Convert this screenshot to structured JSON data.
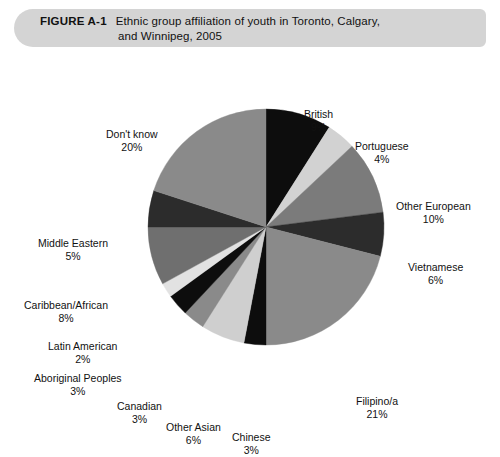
{
  "figure": {
    "label": "FIGURE A-1",
    "caption_line_1": "Ethnic group affiliation of youth in Toronto, Calgary,",
    "caption_line_2": "and Winnipeg, 2005",
    "header_bg": "#d4d4d4"
  },
  "chart_data": {
    "type": "pie",
    "title": "Ethnic group affiliation of youth in Toronto, Calgary, and Winnipeg, 2005",
    "xlabel": "",
    "ylabel": "",
    "legend_position": "none",
    "labels_outside": true,
    "start_angle_deg": 0,
    "direction": "clockwise",
    "units": "percent",
    "categories": [
      "British",
      "Portuguese",
      "Other European",
      "Vietnamese",
      "Filipino/a",
      "Chinese",
      "Other Asian",
      "Canadian",
      "Aboriginal Peoples",
      "Latin American",
      "Caribbean/African",
      "Middle Eastern",
      "Don't know"
    ],
    "values": [
      9,
      4,
      10,
      6,
      21,
      3,
      6,
      3,
      3,
      2,
      8,
      5,
      20
    ],
    "total": 100,
    "colors": [
      "#0d0d0d",
      "#d2d2d2",
      "#7b7b7b",
      "#2c2c2c",
      "#8a8a8a",
      "#0d0d0d",
      "#cfcfcf",
      "#8a8a8a",
      "#0d0d0d",
      "#e2e2e2",
      "#6f6f6f",
      "#2c2c2c",
      "#8a8a8a"
    ],
    "slices": [
      {
        "name": "British",
        "value": 9,
        "value_label": "9%",
        "color": "#0d0d0d"
      },
      {
        "name": "Portuguese",
        "value": 4,
        "value_label": "4%",
        "color": "#d2d2d2"
      },
      {
        "name": "Other European",
        "value": 10,
        "value_label": "10%",
        "color": "#7b7b7b"
      },
      {
        "name": "Vietnamese",
        "value": 6,
        "value_label": "6%",
        "color": "#2c2c2c"
      },
      {
        "name": "Filipino/a",
        "value": 21,
        "value_label": "21%",
        "color": "#8a8a8a"
      },
      {
        "name": "Chinese",
        "value": 3,
        "value_label": "3%",
        "color": "#0d0d0d"
      },
      {
        "name": "Other Asian",
        "value": 6,
        "value_label": "6%",
        "color": "#cfcfcf"
      },
      {
        "name": "Canadian",
        "value": 3,
        "value_label": "3%",
        "color": "#8a8a8a"
      },
      {
        "name": "Aboriginal Peoples",
        "value": 3,
        "value_label": "3%",
        "color": "#0d0d0d"
      },
      {
        "name": "Latin American",
        "value": 2,
        "value_label": "2%",
        "color": "#e2e2e2"
      },
      {
        "name": "Caribbean/African",
        "value": 8,
        "value_label": "8%",
        "color": "#6f6f6f"
      },
      {
        "name": "Middle Eastern",
        "value": 5,
        "value_label": "5%",
        "color": "#2c2c2c"
      },
      {
        "name": "Don't know",
        "value": 20,
        "value_label": "20%",
        "color": "#8a8a8a"
      }
    ]
  },
  "geometry": {
    "center_x": 266,
    "center_y": 179,
    "radius": 118
  }
}
